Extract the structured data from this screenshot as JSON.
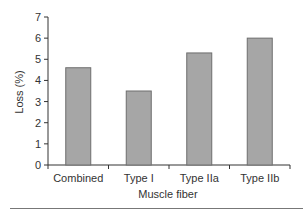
{
  "chart_data": {
    "type": "bar",
    "title": "",
    "xlabel": "Muscle fiber",
    "ylabel": "Loss (%)",
    "categories": [
      "Combined",
      "Type I",
      "Type IIa",
      "Type IIb"
    ],
    "values": [
      4.6,
      3.5,
      5.3,
      6.0
    ],
    "ylim": [
      0,
      7
    ],
    "yticks": [
      0,
      1,
      2,
      3,
      4,
      5,
      6,
      7
    ],
    "grid": false,
    "legend": null,
    "bar_color": "#a6a6a6",
    "bar_edge_color": "#6e6e6e"
  }
}
